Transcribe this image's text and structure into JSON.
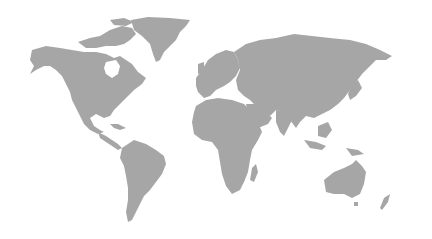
{
  "map": {
    "type": "world-map",
    "projection": "equirectangular-like",
    "land_color": "#a6a6a6",
    "ocean_color": "#ffffff",
    "regions": [
      "north-america",
      "greenland",
      "canadian-arctic-islands",
      "central-america",
      "caribbean",
      "south-america",
      "europe",
      "africa",
      "madagascar",
      "arabian-peninsula",
      "asia",
      "japan",
      "southeast-asia-islands",
      "australia",
      "new-zealand",
      "antarctic-islands"
    ]
  }
}
